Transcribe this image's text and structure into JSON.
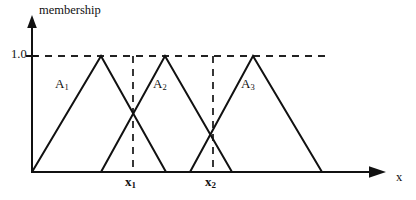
{
  "figure": {
    "title": "",
    "axes": {
      "y_axis_label": "membership",
      "x_axis_label": "x",
      "y_tick_label": "1.0",
      "origin_px": [
        32,
        172
      ],
      "y_top_px": 19,
      "x_right_px": 385
    },
    "labels": {
      "a1": "A",
      "a1_sub": "1",
      "a2": "A",
      "a2_sub": "2",
      "a3": "A",
      "a3_sub": "3",
      "x1": "x",
      "x1_sub": "1",
      "x2": "x",
      "x2_sub": "2"
    },
    "colors": {
      "line": "#111111",
      "dashed": "#222222",
      "background": "#ffffff"
    }
  },
  "chart_data": {
    "type": "line",
    "title": "",
    "subtitle": "",
    "xlabel": "x",
    "ylabel": "membership",
    "grid": false,
    "legend": "inline-annotations",
    "ylim": [
      0,
      1.0
    ],
    "ytick_labels": [
      "1.0"
    ],
    "ytick_values": [
      1.0
    ],
    "xtick_labels": [
      "x1",
      "x2"
    ],
    "xtick_values_px": [
      133,
      213
    ],
    "annotations": [
      "A1",
      "A2",
      "A3",
      "x1",
      "x2",
      "1.0",
      "membership",
      "x"
    ],
    "series": [
      {
        "name": "A1",
        "shape": "triangle",
        "points_px": [
          [
            32,
            172
          ],
          [
            101,
            56
          ],
          [
            166,
            172
          ]
        ],
        "membership_values": [
          0,
          1.0,
          0
        ]
      },
      {
        "name": "A2",
        "shape": "triangle",
        "points_px": [
          [
            101,
            172
          ],
          [
            165,
            56
          ],
          [
            232,
            172
          ]
        ],
        "membership_values": [
          0,
          1.0,
          0
        ]
      },
      {
        "name": "A3",
        "shape": "triangle",
        "points_px": [
          [
            190,
            172
          ],
          [
            253,
            56
          ],
          [
            322,
            172
          ]
        ],
        "membership_values": [
          0,
          1.0,
          0
        ]
      }
    ],
    "reference_lines": [
      {
        "name": "membership-1.0",
        "orientation": "horizontal",
        "value": 1.0,
        "style": "dashed",
        "from_px": [
          32,
          56
        ],
        "to_px": [
          325,
          56
        ]
      },
      {
        "name": "x1",
        "orientation": "vertical",
        "style": "dashed",
        "from_px": [
          133,
          56
        ],
        "to_px": [
          133,
          172
        ]
      },
      {
        "name": "x2",
        "orientation": "vertical",
        "style": "dashed",
        "from_px": [
          213,
          56
        ],
        "to_px": [
          213,
          172
        ]
      }
    ]
  }
}
